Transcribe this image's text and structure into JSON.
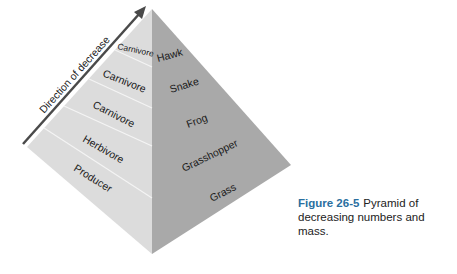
{
  "diagram": {
    "type": "trophic pyramid",
    "arrow_label": "Direction of decrease",
    "levels": [
      {
        "role": "Carnivore",
        "organism": "Hawk"
      },
      {
        "role": "Carnivore",
        "organism": "Snake"
      },
      {
        "role": "Carnivore",
        "organism": "Frog"
      },
      {
        "role": "Herbivore",
        "organism": "Grasshopper"
      },
      {
        "role": "Producer",
        "organism": "Grass"
      }
    ],
    "colors": {
      "left_face": "#dcdcdc",
      "right_face": "#a9a9a9",
      "divider": "#f4f4f4",
      "arrow": "#4a4a4a",
      "caption_figure": "#2a6fa0"
    }
  },
  "caption": {
    "figure_label": "Figure 26-5",
    "text": "Pyramid of decreasing numbers and mass."
  }
}
